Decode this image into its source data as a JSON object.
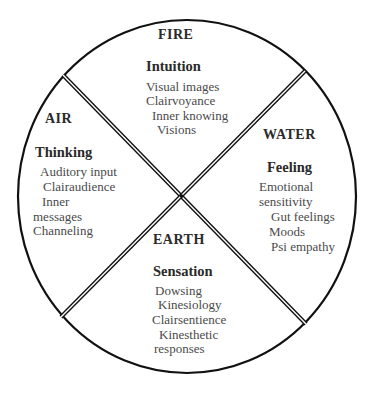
{
  "diagram": {
    "colors": {
      "stroke": "#111111",
      "heading_text": "#2a2a2a",
      "body_text": "#4a4a4a",
      "background": "#ffffff"
    },
    "quadrants": [
      {
        "position": "top",
        "element": "FIRE",
        "function": "Intuition",
        "items": [
          "Visual images",
          "Clairvoyance",
          "Inner knowing",
          "Visions"
        ]
      },
      {
        "position": "left",
        "element": "AIR",
        "function": "Thinking",
        "items": [
          "Auditory input",
          "Clairaudience",
          "Inner",
          "messages",
          "Channeling"
        ]
      },
      {
        "position": "right",
        "element": "WATER",
        "function": "Feeling",
        "items": [
          "Emotional",
          "sensitivity",
          "Gut feelings",
          "Moods",
          "Psi empathy"
        ]
      },
      {
        "position": "bottom",
        "element": "EARTH",
        "function": "Sensation",
        "items": [
          "Dowsing",
          "Kinesiology",
          "Clairsentience",
          "Kinesthetic",
          "responses"
        ]
      }
    ]
  }
}
